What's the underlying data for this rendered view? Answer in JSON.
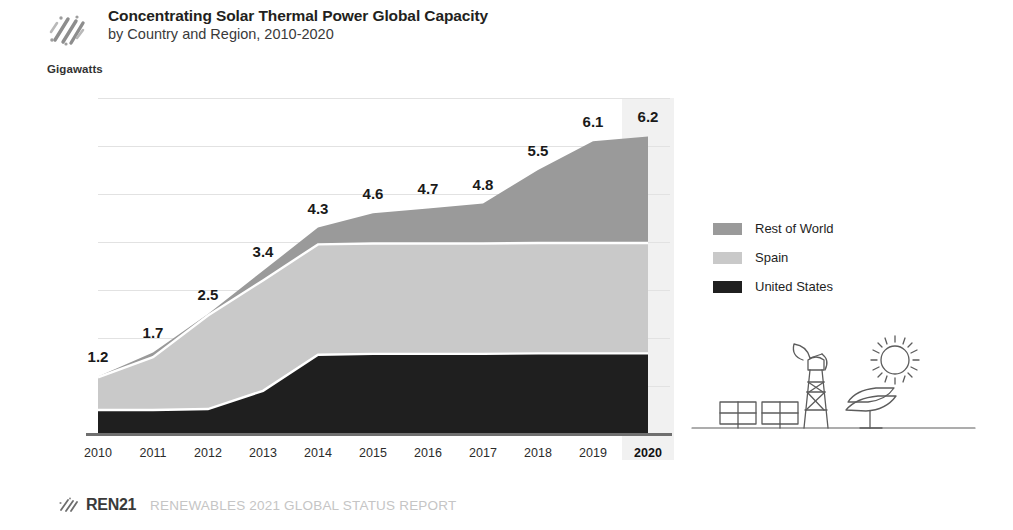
{
  "header": {
    "icon": "diagonal-lines-icon",
    "title": "Concentrating Solar Thermal Power Global Capacity",
    "subtitle": "by Country and Region, 2010-2020"
  },
  "axis": {
    "unit_label": "Gigawatts"
  },
  "legend": {
    "items": [
      {
        "label": "Rest of World",
        "color": "#9a9a9a"
      },
      {
        "label": "Spain",
        "color": "#c9c9c9"
      },
      {
        "label": "United States",
        "color": "#1f1f1f"
      }
    ]
  },
  "illustration": {
    "name": "csp-plant-illustration",
    "parts": [
      "solar-panels-icon",
      "solar-tower-icon",
      "parabolic-dish-icon",
      "sun-icon"
    ]
  },
  "footer": {
    "icon": "ren21-mark-icon",
    "brand": "REN21",
    "report": "RENEWABLES 2021 GLOBAL STATUS REPORT"
  },
  "colors": {
    "rest_of_world": "#9a9a9a",
    "spain": "#c9c9c9",
    "united_states": "#1f1f1f",
    "gridline": "#e2e2e2",
    "baseline": "#6f6f6f",
    "highlight_band": "#f1f1f1",
    "title": "#231f20",
    "footer_report": "#c5c5c5"
  },
  "chart_data": {
    "type": "area",
    "title": "Concentrating Solar Thermal Power Global Capacity",
    "subtitle": "by Country and Region, 2010-2020",
    "stacked": true,
    "xlabel": "",
    "ylabel": "Gigawatts",
    "ylim": [
      0,
      7
    ],
    "yticks": [
      0,
      1,
      2,
      3,
      4,
      5,
      6,
      7
    ],
    "grid": true,
    "legend_position": "right",
    "highlighted_category": "2020",
    "categories": [
      "2010",
      "2011",
      "2012",
      "2013",
      "2014",
      "2015",
      "2016",
      "2017",
      "2018",
      "2019",
      "2020"
    ],
    "series": [
      {
        "name": "United States",
        "color": "#1f1f1f",
        "values": [
          0.5,
          0.5,
          0.52,
          0.9,
          1.65,
          1.67,
          1.67,
          1.67,
          1.68,
          1.68,
          1.68
        ]
      },
      {
        "name": "Spain",
        "color": "#c9c9c9",
        "values": [
          0.68,
          1.1,
          1.95,
          2.3,
          2.3,
          2.3,
          2.3,
          2.3,
          2.3,
          2.3,
          2.3
        ]
      },
      {
        "name": "Rest of World",
        "color": "#9a9a9a",
        "values": [
          0.02,
          0.1,
          0.03,
          0.2,
          0.35,
          0.63,
          0.73,
          0.83,
          1.52,
          2.12,
          2.22
        ]
      }
    ],
    "totals": [
      1.2,
      1.7,
      2.5,
      3.4,
      4.3,
      4.6,
      4.7,
      4.8,
      5.5,
      6.1,
      6.2
    ],
    "data_labels": [
      "1.2",
      "1.7",
      "2.5",
      "3.4",
      "4.3",
      "4.6",
      "4.7",
      "4.8",
      "5.5",
      "6.1",
      "6.2"
    ]
  }
}
